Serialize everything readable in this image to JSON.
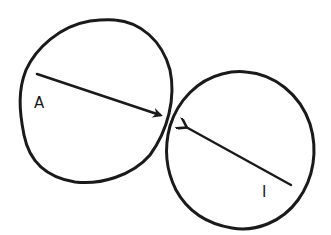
{
  "diagram": {
    "type": "two-circle interaction sketch",
    "style": "hand-drawn black ink on white",
    "colors": {
      "ink": "#1a1a1a",
      "background": "#ffffff"
    },
    "nodes": [
      {
        "id": "A",
        "label": "A",
        "shape": "circle",
        "position": "left-top"
      },
      {
        "id": "I",
        "label": "I",
        "shape": "circle",
        "position": "right-bottom"
      }
    ],
    "edges": [
      {
        "from": "A",
        "to": "I",
        "description": "arrow from inside circle A pointing to its right edge, toward circle I"
      },
      {
        "from": "I",
        "to": "A",
        "description": "arrow from inside circle I pointing to its upper-left edge, toward circle A"
      }
    ]
  }
}
